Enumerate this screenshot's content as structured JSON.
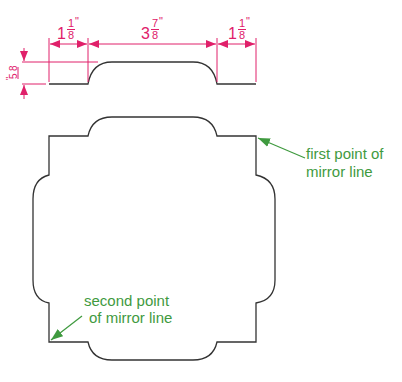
{
  "colors": {
    "dimension": "#e0206a",
    "outline": "#333333",
    "annotation": "#3f9a3f"
  },
  "dimensions": {
    "left_width": {
      "whole": "1",
      "num": "1",
      "den": "8",
      "unit": "\""
    },
    "middle_width": {
      "whole": "3",
      "num": "7",
      "den": "8",
      "unit": "\""
    },
    "right_width": {
      "whole": "1",
      "num": "1",
      "den": "8",
      "unit": "\""
    },
    "height": {
      "num": "5",
      "den": "8",
      "unit": "\""
    }
  },
  "annotations": {
    "first_point": [
      "first point of",
      "mirror line"
    ],
    "second_point": [
      "second point",
      "of mirror line"
    ]
  }
}
